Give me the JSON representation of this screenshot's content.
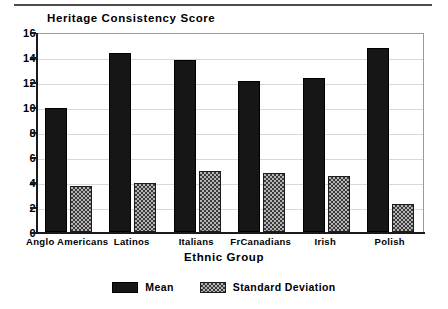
{
  "chart_data": {
    "type": "bar",
    "title": "Heritage Consistency Score",
    "xlabel": "Ethnic Group",
    "ylabel": "",
    "categories": [
      "Anglo Americans",
      "Latinos",
      "Italians",
      "FrCanadians",
      "Irish",
      "Polish"
    ],
    "series": [
      {
        "name": "Mean",
        "values": [
          9.9,
          14.3,
          13.75,
          12.05,
          12.35,
          14.7
        ],
        "color": "#161616"
      },
      {
        "name": "Standard Deviation",
        "values": [
          3.7,
          3.9,
          4.9,
          4.7,
          4.5,
          2.25
        ],
        "color": "#b4b4b4"
      }
    ],
    "ylim": [
      0,
      16
    ],
    "yticks": [
      0,
      2,
      4,
      6,
      8,
      10,
      12,
      14,
      16
    ],
    "ytick_labels": [
      "0",
      "2",
      "4",
      "6",
      "8",
      "10",
      "12",
      "14",
      "16"
    ],
    "grid": true,
    "legend_position": "bottom"
  },
  "legend": {
    "items": [
      {
        "label": "Mean",
        "swatch": "mean"
      },
      {
        "label": "Standard Deviation",
        "swatch": "sd"
      }
    ]
  }
}
